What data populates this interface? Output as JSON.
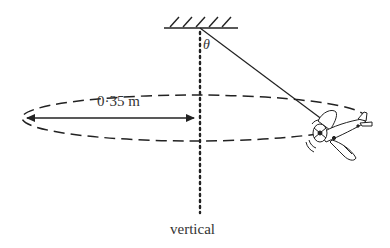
{
  "diagram": {
    "type": "physics-conical-pendulum",
    "labels": {
      "angle": "θ",
      "radius": "0·35 m",
      "axis": "vertical"
    },
    "colors": {
      "stroke": "#222222",
      "text": "#333333",
      "background": "#ffffff"
    },
    "geometry": {
      "pivot": [
        200,
        28
      ],
      "ceiling": {
        "x1": 164,
        "x2": 238,
        "y": 28
      },
      "ellipse": {
        "cx": 194,
        "cy": 118,
        "rx": 172,
        "ry": 23
      },
      "radius_arrow": {
        "x1": 24,
        "x2": 196,
        "y": 118
      },
      "string_end": [
        330,
        126
      ],
      "vertical_line": {
        "x": 200,
        "y1": 30,
        "y2": 213
      }
    }
  }
}
